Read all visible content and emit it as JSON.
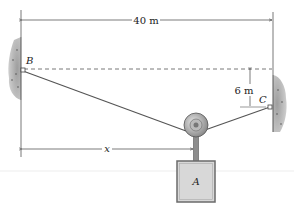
{
  "diagram": {
    "labels": {
      "span": "40 m",
      "sag": "6 m",
      "x": "x",
      "point_b": "B",
      "point_c": "C",
      "block": "A"
    },
    "colors": {
      "wall": "#8a8a8a",
      "cable": "#555555",
      "dimension": "#444444",
      "block_fill": "#d8d8d8",
      "block_border": "#6b6b6b",
      "pulley": "#9a9a9a"
    }
  }
}
